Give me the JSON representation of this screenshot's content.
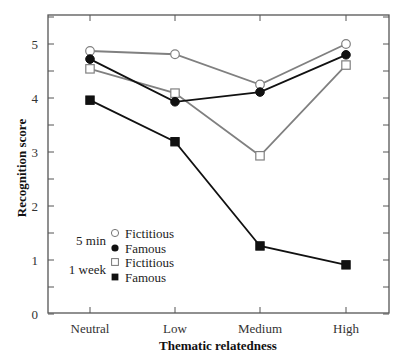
{
  "chart_data": {
    "type": "line",
    "title": "",
    "xlabel": "Thematic relatedness",
    "ylabel": "Recognition score",
    "categories": [
      "Neutral",
      "Low",
      "Medium",
      "High"
    ],
    "ylim": [
      0,
      5.5
    ],
    "yticks": [
      0,
      1,
      2,
      3,
      4,
      5
    ],
    "yminor_ticks": [
      0.5,
      1.5,
      2.5,
      3.5,
      4.5,
      5.5
    ],
    "grid": false,
    "legend_position": "lower-left inside",
    "legend_groups": [
      {
        "label": "5 min",
        "entries": [
          "Fictitious",
          "Famous"
        ]
      },
      {
        "label": "1 week",
        "entries": [
          "Fictitious",
          "Famous"
        ]
      }
    ],
    "series": [
      {
        "name": "5 min Fictitious",
        "group": "5 min",
        "label": "Fictitious",
        "marker": "open-circle",
        "color": "#808080",
        "values": [
          4.87,
          4.81,
          4.25,
          5.0
        ]
      },
      {
        "name": "5 min Famous",
        "group": "5 min",
        "label": "Famous",
        "marker": "filled-circle",
        "color": "#111111",
        "values": [
          4.72,
          3.93,
          4.11,
          4.8
        ]
      },
      {
        "name": "1 week Fictitious",
        "group": "1 week",
        "label": "Fictitious",
        "marker": "open-square",
        "color": "#808080",
        "values": [
          4.54,
          4.09,
          2.93,
          4.61
        ]
      },
      {
        "name": "1 week Famous",
        "group": "1 week",
        "label": "Famous",
        "marker": "filled-square",
        "color": "#111111",
        "values": [
          3.96,
          3.19,
          1.26,
          0.91
        ]
      }
    ]
  }
}
